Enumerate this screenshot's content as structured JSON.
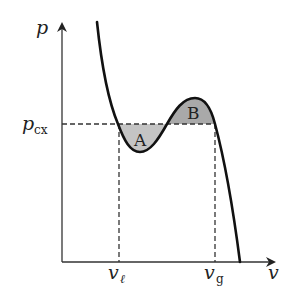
{
  "diagram": {
    "title": "",
    "axes": {
      "x_label": "v",
      "y_label": "p"
    },
    "pressure_label": {
      "base": "p",
      "subscript": "cx"
    },
    "volume_labels": [
      {
        "base": "v",
        "subscript": "ℓ"
      },
      {
        "base": "v",
        "subscript": "g"
      }
    ],
    "regions": [
      {
        "label": "A"
      },
      {
        "label": "B"
      }
    ],
    "colors": {
      "curve": "#111111",
      "axis": "#333333",
      "dashed": "#333333",
      "region_A_fill": "#c8c8c8",
      "region_B_fill": "#a8a8a8"
    }
  }
}
